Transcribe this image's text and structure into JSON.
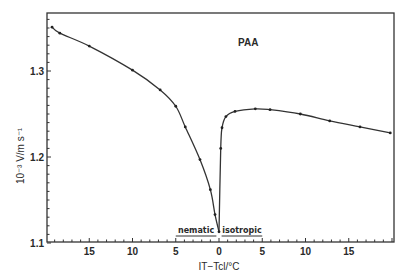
{
  "chart_data": {
    "type": "line",
    "title": "PAA",
    "xlabel": "IT−Tcl/°C",
    "ylabel": "10⁻³ V/m s⁻¹",
    "xlim": [
      -19.9,
      20.2
    ],
    "ylim": [
      1.1,
      1.367
    ],
    "x_ticks": [
      -15,
      -10,
      -5,
      0,
      5,
      10,
      15
    ],
    "x_tick_labels": [
      "15",
      "10",
      "5",
      "0",
      "5",
      "10",
      "15"
    ],
    "y_ticks": [
      1.1,
      1.2,
      1.3
    ],
    "y_tick_labels": [
      "1.1",
      "1.2",
      "1.3"
    ],
    "annotations": [
      {
        "text": "nematic",
        "x_range": [
          -5,
          -0.3
        ]
      },
      {
        "text": "isotropic",
        "x_range": [
          0.3,
          5
        ]
      }
    ],
    "grid": false,
    "series": [
      {
        "name": "PAA",
        "x": [
          -19.3,
          -18.4,
          -15,
          -10,
          -6.8,
          -5,
          -3.9,
          -2.2,
          -1.0,
          -0.46,
          0,
          0.2,
          0.35,
          0.8,
          1.85,
          4.2,
          5.9,
          9.4,
          12.8,
          16.3,
          19.8
        ],
        "y": [
          1.351,
          1.344,
          1.329,
          1.301,
          1.278,
          1.259,
          1.235,
          1.197,
          1.162,
          1.133,
          1.113,
          1.21,
          1.234,
          1.247,
          1.253,
          1.256,
          1.255,
          1.25,
          1.242,
          1.235,
          1.228
        ]
      }
    ]
  }
}
